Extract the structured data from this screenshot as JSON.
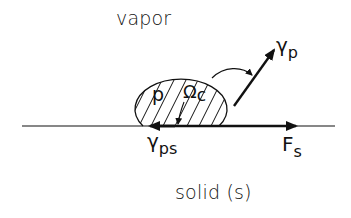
{
  "diagram": {
    "type": "wetting-droplet-force-balance",
    "regions": {
      "top": "vapor",
      "bottom": "solid (s)"
    },
    "droplet": {
      "label": "p",
      "hatched": true
    },
    "labels": {
      "angle": {
        "main": "Ω",
        "sub": "c"
      },
      "gamma_p": {
        "main": "γ",
        "sub": "p"
      },
      "gamma_ps": {
        "main": "γ",
        "sub": "ps"
      },
      "force_s": {
        "main": "F",
        "sub": "s"
      }
    },
    "colors": {
      "ink": "#111111",
      "background": "#ffffff"
    }
  }
}
